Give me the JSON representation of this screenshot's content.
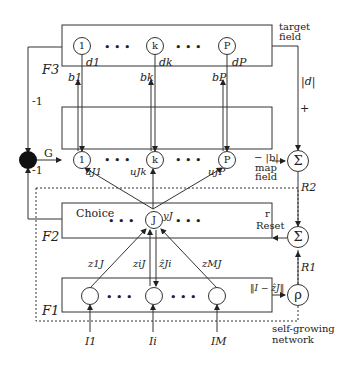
{
  "diagram": {
    "layers": {
      "f3": {
        "label": "F3",
        "caption": [
          "target",
          "field"
        ],
        "nodes": [
          "1",
          "k",
          "P"
        ],
        "outputs": [
          "d1",
          "dk",
          "dP"
        ]
      },
      "map": {
        "caption": [
          "map",
          "field"
        ],
        "nodes": [
          "1",
          "k",
          "P"
        ],
        "feedback": [
          "b1",
          "bk",
          "bP"
        ],
        "input_label": "G"
      },
      "f2": {
        "label": "F2",
        "caption": "Choice",
        "node": "J",
        "output": "yJ"
      },
      "f1": {
        "label": "F1",
        "inputs": [
          "I1",
          "Ii",
          "IM"
        ]
      }
    },
    "weights": {
      "u": [
        "uJ1",
        "uJk",
        "uJP"
      ],
      "z": [
        "z1J",
        "ziJ",
        "ẑJi",
        "zMJ"
      ]
    },
    "signals": {
      "abs_d": "|d|",
      "plus": "+",
      "minus_b": "− |b|",
      "R2": "R2",
      "R1": "R1",
      "r": "r",
      "reset": "Reset",
      "norm": "‖I − ẑJ‖",
      "rho": "ρ",
      "neg1_top": "-1",
      "neg1_bottom": "-1",
      "sigma": "Σ"
    },
    "region_label": [
      "self-growing",
      "network"
    ],
    "ellipsis": "• • •"
  }
}
